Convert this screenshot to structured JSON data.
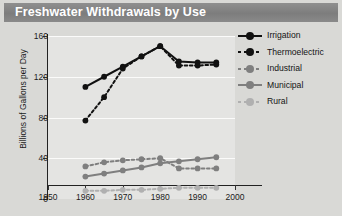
{
  "window": {
    "title": "Freshwater Withdrawals by Use"
  },
  "legend": {
    "position": "right",
    "items": [
      {
        "label": "Irrigation",
        "key": "irrigation",
        "color": "#111111",
        "dash": "solid",
        "marker": "circle"
      },
      {
        "label": "Thermoelectric",
        "key": "thermoelectric",
        "color": "#111111",
        "dash": "dashed",
        "marker": "circle"
      },
      {
        "label": "Industrial",
        "key": "industrial",
        "color": "#7f7f7f",
        "dash": "dashed",
        "marker": "circle"
      },
      {
        "label": "Municipal",
        "key": "municipal",
        "color": "#7f7f7f",
        "dash": "solid",
        "marker": "circle"
      },
      {
        "label": "Rural",
        "key": "rural",
        "color": "#b0b0b0",
        "dash": "dashed",
        "marker": "circle"
      }
    ]
  },
  "chart_data": {
    "type": "line",
    "title": "Freshwater Withdrawals by Use",
    "xlabel": "",
    "ylabel": "Billions of Gallons per Day",
    "xlim": [
      1950,
      2000
    ],
    "ylim": [
      0,
      160
    ],
    "xticks": [
      1950,
      1960,
      1970,
      1980,
      1990,
      2000
    ],
    "yticks": [
      0,
      40,
      80,
      120,
      160
    ],
    "grid": "horizontal",
    "x": [
      1960,
      1965,
      1970,
      1975,
      1980,
      1985,
      1990,
      1995
    ],
    "series": [
      {
        "name": "Irrigation",
        "color": "#111111",
        "dash": "solid",
        "values": [
          110,
          120,
          130,
          140,
          150,
          135,
          134,
          134
        ]
      },
      {
        "name": "Thermoelectric",
        "color": "#111111",
        "dash": "dashed",
        "values": [
          77,
          100,
          128,
          140,
          150,
          131,
          131,
          132
        ]
      },
      {
        "name": "Industrial",
        "color": "#7f7f7f",
        "dash": "dashed",
        "values": [
          32,
          36,
          38,
          39,
          40,
          30,
          30,
          30
        ]
      },
      {
        "name": "Municipal",
        "color": "#7f7f7f",
        "dash": "solid",
        "values": [
          22,
          25,
          28,
          31,
          35,
          37,
          39,
          41
        ]
      },
      {
        "name": "Rural",
        "color": "#b0b0b0",
        "dash": "dashed",
        "values": [
          8,
          8,
          9,
          9,
          10,
          11,
          11,
          11
        ]
      }
    ]
  }
}
